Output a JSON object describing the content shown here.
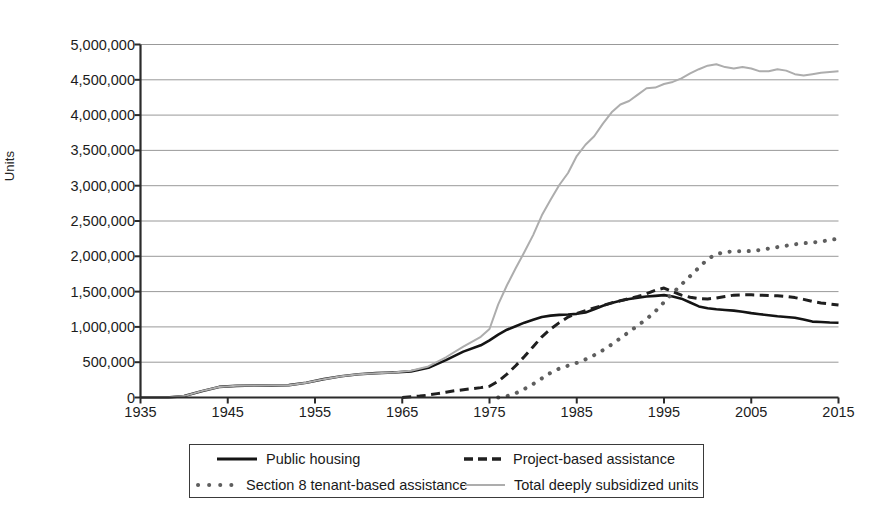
{
  "chart_data": {
    "type": "line",
    "title": "",
    "xlabel": "",
    "ylabel": "Units",
    "xlim": [
      1935,
      2015
    ],
    "ylim": [
      0,
      5000000
    ],
    "grid": true,
    "legend_position": "bottom",
    "x_ticks": [
      1935,
      1945,
      1955,
      1965,
      1975,
      1985,
      1995,
      2005,
      2015
    ],
    "y_ticks": [
      0,
      500000,
      1000000,
      1500000,
      2000000,
      2500000,
      3000000,
      3500000,
      4000000,
      4500000,
      5000000
    ],
    "y_tick_labels": [
      "0",
      "500,000",
      "1,000,000",
      "1,500,000",
      "2,000,000",
      "2,500,000",
      "3,000,000",
      "3,500,000",
      "4,000,000",
      "4,500,000",
      "5,000,000"
    ],
    "x_tick_labels": [
      "1935",
      "1945",
      "1955",
      "1965",
      "1975",
      "1985",
      "1995",
      "2005",
      "2015"
    ],
    "series": [
      {
        "name": "Public housing",
        "style": "solid",
        "color": "#141414",
        "width": 2.6,
        "x": [
          1935,
          1938,
          1940,
          1942,
          1944,
          1946,
          1948,
          1950,
          1952,
          1954,
          1956,
          1958,
          1960,
          1962,
          1964,
          1966,
          1968,
          1970,
          1972,
          1974,
          1975,
          1976,
          1977,
          1978,
          1979,
          1980,
          1981,
          1982,
          1983,
          1984,
          1985,
          1986,
          1987,
          1988,
          1989,
          1990,
          1991,
          1992,
          1993,
          1994,
          1995,
          1996,
          1997,
          1998,
          1999,
          2000,
          2001,
          2002,
          2003,
          2004,
          2005,
          2006,
          2007,
          2008,
          2009,
          2010,
          2011,
          2012,
          2013,
          2014,
          2015
        ],
        "y": [
          0,
          0,
          20000,
          90000,
          150000,
          165000,
          170000,
          172000,
          175000,
          210000,
          260000,
          300000,
          330000,
          345000,
          355000,
          370000,
          420000,
          530000,
          650000,
          740000,
          810000,
          890000,
          960000,
          1010000,
          1060000,
          1100000,
          1140000,
          1160000,
          1170000,
          1175000,
          1185000,
          1205000,
          1250000,
          1300000,
          1340000,
          1370000,
          1395000,
          1415000,
          1430000,
          1440000,
          1450000,
          1430000,
          1400000,
          1345000,
          1290000,
          1265000,
          1250000,
          1240000,
          1230000,
          1215000,
          1195000,
          1180000,
          1165000,
          1150000,
          1140000,
          1130000,
          1105000,
          1075000,
          1070000,
          1062000,
          1058000
        ]
      },
      {
        "name": "Project-based assistance",
        "style": "dashed",
        "color": "#1f1f1f",
        "width": 3.0,
        "x": [
          1965,
          1966,
          1967,
          1968,
          1969,
          1970,
          1971,
          1972,
          1973,
          1974,
          1975,
          1976,
          1977,
          1978,
          1979,
          1980,
          1981,
          1982,
          1983,
          1984,
          1985,
          1986,
          1987,
          1988,
          1989,
          1990,
          1991,
          1992,
          1993,
          1994,
          1995,
          1996,
          1997,
          1998,
          1999,
          2000,
          2001,
          2002,
          2003,
          2004,
          2005,
          2006,
          2007,
          2008,
          2009,
          2010,
          2011,
          2012,
          2013,
          2014,
          2015
        ],
        "y": [
          0,
          10000,
          20000,
          35000,
          55000,
          75000,
          95000,
          110000,
          125000,
          140000,
          160000,
          230000,
          330000,
          450000,
          580000,
          720000,
          860000,
          970000,
          1060000,
          1140000,
          1190000,
          1230000,
          1270000,
          1305000,
          1340000,
          1370000,
          1400000,
          1430000,
          1470000,
          1520000,
          1550000,
          1500000,
          1450000,
          1420000,
          1400000,
          1395000,
          1410000,
          1430000,
          1450000,
          1455000,
          1455000,
          1450000,
          1445000,
          1440000,
          1430000,
          1415000,
          1390000,
          1360000,
          1340000,
          1325000,
          1310000
        ]
      },
      {
        "name": "Section 8 tenant-based assistance",
        "style": "dotted",
        "color": "#5e5e5e",
        "width": 4.0,
        "x": [
          1976,
          1977,
          1978,
          1979,
          1980,
          1981,
          1982,
          1983,
          1984,
          1985,
          1986,
          1987,
          1988,
          1989,
          1990,
          1991,
          1992,
          1993,
          1994,
          1995,
          1996,
          1997,
          1998,
          1999,
          2000,
          2001,
          2002,
          2003,
          2004,
          2005,
          2006,
          2007,
          2008,
          2009,
          2010,
          2011,
          2012,
          2013,
          2014,
          2015
        ],
        "y": [
          0,
          20000,
          60000,
          120000,
          190000,
          270000,
          350000,
          410000,
          450000,
          490000,
          540000,
          600000,
          670000,
          750000,
          840000,
          930000,
          1020000,
          1110000,
          1220000,
          1350000,
          1480000,
          1600000,
          1720000,
          1840000,
          1960000,
          2030000,
          2060000,
          2070000,
          2070000,
          2075000,
          2090000,
          2110000,
          2130000,
          2150000,
          2170000,
          2185000,
          2195000,
          2210000,
          2230000,
          2250000
        ]
      },
      {
        "name": "Total deeply subsidized units",
        "style": "solid",
        "color": "#adadad",
        "width": 2.0,
        "x": [
          1935,
          1938,
          1940,
          1942,
          1944,
          1946,
          1948,
          1950,
          1952,
          1954,
          1956,
          1958,
          1960,
          1962,
          1964,
          1966,
          1968,
          1970,
          1972,
          1974,
          1975,
          1976,
          1977,
          1978,
          1979,
          1980,
          1981,
          1982,
          1983,
          1984,
          1985,
          1986,
          1987,
          1988,
          1989,
          1990,
          1991,
          1992,
          1993,
          1994,
          1995,
          1996,
          1997,
          1998,
          1999,
          2000,
          2001,
          2002,
          2003,
          2004,
          2005,
          2006,
          2007,
          2008,
          2009,
          2010,
          2011,
          2012,
          2013,
          2014,
          2015
        ],
        "y": [
          0,
          0,
          20000,
          90000,
          150000,
          165000,
          170000,
          172000,
          175000,
          210000,
          260000,
          300000,
          330000,
          345000,
          355000,
          380000,
          440000,
          570000,
          720000,
          860000,
          970000,
          1320000,
          1590000,
          1830000,
          2060000,
          2300000,
          2580000,
          2800000,
          3010000,
          3180000,
          3420000,
          3580000,
          3700000,
          3880000,
          4040000,
          4150000,
          4200000,
          4290000,
          4380000,
          4390000,
          4440000,
          4470000,
          4520000,
          4590000,
          4650000,
          4700000,
          4720000,
          4680000,
          4660000,
          4680000,
          4660000,
          4620000,
          4620000,
          4650000,
          4630000,
          4580000,
          4560000,
          4580000,
          4600000,
          4610000,
          4620000
        ]
      }
    ]
  },
  "legend": {
    "items": [
      {
        "label": "Public housing",
        "style": "solid-dark"
      },
      {
        "label": "Project-based assistance",
        "style": "dashed-dark"
      },
      {
        "label": "Section 8 tenant-based assistance",
        "style": "dotted-gray"
      },
      {
        "label": "Total deeply subsidized units",
        "style": "solid-gray"
      }
    ]
  },
  "axes": {
    "y_title": "Units"
  }
}
